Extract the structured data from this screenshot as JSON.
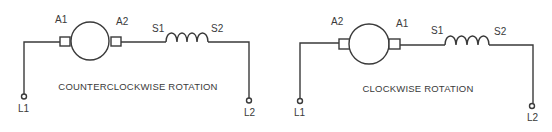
{
  "diagrams": [
    {
      "id": "ccw",
      "caption": "COUNTERCLOCKWISE ROTATION",
      "labels": {
        "left_brush": "A1",
        "right_brush": "A2",
        "field_start": "S1",
        "field_end": "S2",
        "line1": "L1",
        "line2": "L2"
      }
    },
    {
      "id": "cw",
      "caption": "CLOCKWISE ROTATION",
      "labels": {
        "left_brush": "A2",
        "right_brush": "A1",
        "field_start": "S1",
        "field_end": "S2",
        "line1": "L1",
        "line2": "L2"
      }
    }
  ],
  "colors": {
    "line": "#3a3a3a",
    "background": "#ffffff"
  }
}
